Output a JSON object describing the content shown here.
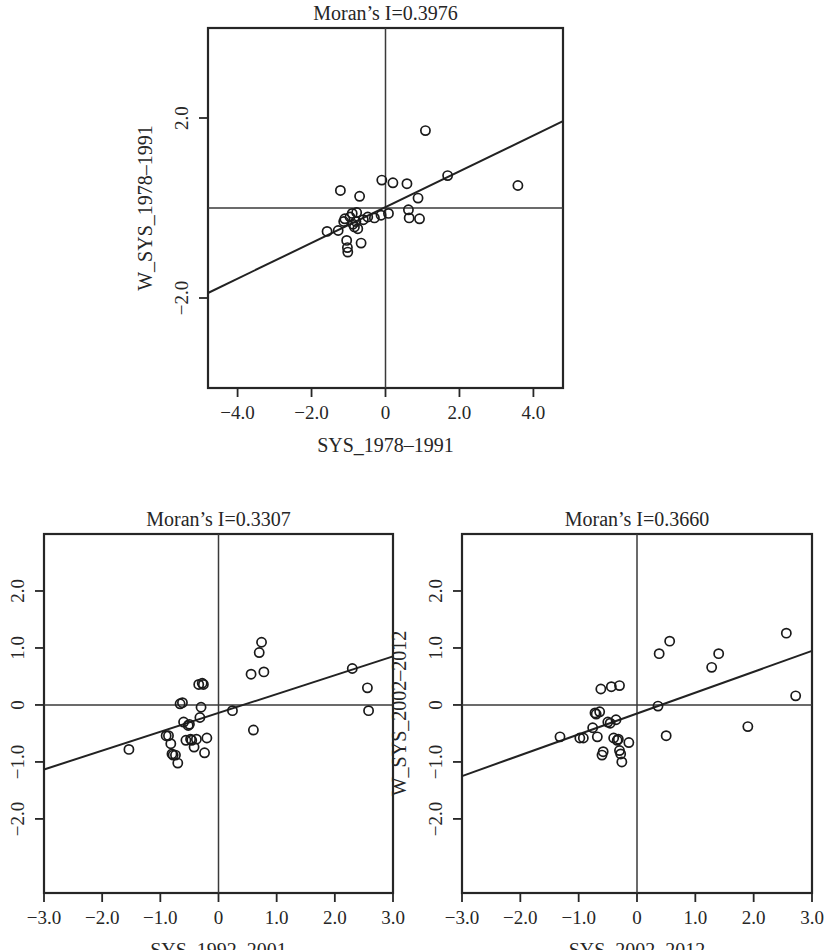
{
  "figure": {
    "background": "#ffffff",
    "marker_color": "#1a1a1a",
    "line_color": "#222222"
  },
  "chart_data": [
    {
      "type": "scatter",
      "id": "moran-1978-1991",
      "title": "Moran’s I=0.3976",
      "xlabel": "SYS_1978–1991",
      "ylabel": "W_SYS_1978–1991",
      "xlim": [
        -4.8,
        4.8
      ],
      "ylim": [
        -4.0,
        4.0
      ],
      "xticks": [
        -4.0,
        -2.0,
        0,
        2.0,
        4.0
      ],
      "xticklabels": [
        "−4.0",
        "−2.0",
        "0",
        "2.0",
        "4.0"
      ],
      "yticks": [
        2.0,
        -2.0
      ],
      "yticklabels": [
        "2.0",
        "−2.0"
      ],
      "grid": false,
      "zero_lines": true,
      "legend": null,
      "fit_line": {
        "slope": 0.3976,
        "intercept": 0.02
      },
      "points": [
        {
          "x": -1.58,
          "y": -0.52
        },
        {
          "x": -1.28,
          "y": -0.5
        },
        {
          "x": -1.22,
          "y": 0.39
        },
        {
          "x": -1.13,
          "y": -0.3
        },
        {
          "x": -1.1,
          "y": -0.24
        },
        {
          "x": -1.05,
          "y": -0.72
        },
        {
          "x": -1.03,
          "y": -0.88
        },
        {
          "x": -1.02,
          "y": -0.98
        },
        {
          "x": -0.96,
          "y": -0.2
        },
        {
          "x": -0.9,
          "y": -0.12
        },
        {
          "x": -0.88,
          "y": -0.36
        },
        {
          "x": -0.84,
          "y": -0.42
        },
        {
          "x": -0.8,
          "y": -0.3
        },
        {
          "x": -0.78,
          "y": -0.1
        },
        {
          "x": -0.75,
          "y": -0.46
        },
        {
          "x": -0.7,
          "y": 0.26
        },
        {
          "x": -0.66,
          "y": -0.78
        },
        {
          "x": -0.6,
          "y": -0.26
        },
        {
          "x": -0.48,
          "y": -0.2
        },
        {
          "x": -0.3,
          "y": -0.22
        },
        {
          "x": -0.12,
          "y": -0.16
        },
        {
          "x": -0.1,
          "y": 0.62
        },
        {
          "x": 0.08,
          "y": -0.12
        },
        {
          "x": 0.2,
          "y": 0.56
        },
        {
          "x": 0.58,
          "y": 0.54
        },
        {
          "x": 0.62,
          "y": -0.04
        },
        {
          "x": 0.64,
          "y": -0.22
        },
        {
          "x": 0.88,
          "y": 0.22
        },
        {
          "x": 0.92,
          "y": -0.24
        },
        {
          "x": 1.08,
          "y": 1.72
        },
        {
          "x": 1.68,
          "y": 0.72
        },
        {
          "x": 3.58,
          "y": 0.5
        }
      ]
    },
    {
      "type": "scatter",
      "id": "moran-1992-2001",
      "title": "Moran’s I=0.3307",
      "xlabel": "SYS_1992–2001",
      "ylabel": "W_SYS_1992–2001",
      "xlim": [
        -3.0,
        3.0
      ],
      "ylim": [
        -3.3,
        3.0
      ],
      "xticks": [
        -3.0,
        -2.0,
        -1.0,
        0,
        1.0,
        2.0,
        3.0
      ],
      "xticklabels": [
        "−3.0",
        "−2.0",
        "−1.0",
        "0",
        "1.0",
        "2.0",
        "3.0"
      ],
      "yticks": [
        2.0,
        1.0,
        0,
        -1.0,
        -2.0
      ],
      "yticklabels": [
        "2.0",
        "1.0",
        "0",
        "−1.0",
        "−2.0"
      ],
      "grid": false,
      "zero_lines": true,
      "legend": null,
      "fit_line": {
        "slope": 0.3307,
        "intercept": -0.14
      },
      "points": [
        {
          "x": -1.54,
          "y": -0.78
        },
        {
          "x": -0.9,
          "y": -0.54
        },
        {
          "x": -0.86,
          "y": -0.54
        },
        {
          "x": -0.82,
          "y": -0.68
        },
        {
          "x": -0.8,
          "y": -0.86
        },
        {
          "x": -0.78,
          "y": -0.88
        },
        {
          "x": -0.74,
          "y": -0.88
        },
        {
          "x": -0.7,
          "y": -1.02
        },
        {
          "x": -0.66,
          "y": 0.02
        },
        {
          "x": -0.62,
          "y": 0.04
        },
        {
          "x": -0.6,
          "y": -0.3
        },
        {
          "x": -0.56,
          "y": -0.62
        },
        {
          "x": -0.52,
          "y": -0.36
        },
        {
          "x": -0.5,
          "y": -0.34
        },
        {
          "x": -0.48,
          "y": -0.6
        },
        {
          "x": -0.46,
          "y": -0.62
        },
        {
          "x": -0.42,
          "y": -0.74
        },
        {
          "x": -0.38,
          "y": -0.6
        },
        {
          "x": -0.34,
          "y": 0.36
        },
        {
          "x": -0.32,
          "y": -0.22
        },
        {
          "x": -0.3,
          "y": -0.04
        },
        {
          "x": -0.28,
          "y": 0.38
        },
        {
          "x": -0.26,
          "y": 0.36
        },
        {
          "x": -0.24,
          "y": -0.84
        },
        {
          "x": -0.2,
          "y": -0.58
        },
        {
          "x": 0.24,
          "y": -0.1
        },
        {
          "x": 0.56,
          "y": 0.54
        },
        {
          "x": 0.6,
          "y": -0.44
        },
        {
          "x": 0.7,
          "y": 0.92
        },
        {
          "x": 0.74,
          "y": 1.1
        },
        {
          "x": 0.78,
          "y": 0.58
        },
        {
          "x": 2.3,
          "y": 0.64
        },
        {
          "x": 2.56,
          "y": 0.3
        },
        {
          "x": 2.58,
          "y": -0.1
        }
      ]
    },
    {
      "type": "scatter",
      "id": "moran-2002-2012",
      "title": "Moran’s I=0.3660",
      "xlabel": "SYS_2002–2012",
      "ylabel": "W_SYS_2002–2012",
      "xlim": [
        -3.0,
        3.0
      ],
      "ylim": [
        -3.3,
        3.0
      ],
      "xticks": [
        -3.0,
        -2.0,
        -1.0,
        0,
        1.0,
        2.0,
        3.0
      ],
      "xticklabels": [
        "−3.0",
        "−2.0",
        "−1.0",
        "0",
        "1.0",
        "2.0",
        "3.0"
      ],
      "yticks": [
        2.0,
        1.0,
        0,
        -1.0,
        -2.0
      ],
      "yticklabels": [
        "2.0",
        "1.0",
        "0",
        "−1.0",
        "−2.0"
      ],
      "grid": false,
      "zero_lines": true,
      "legend": null,
      "fit_line": {
        "slope": 0.366,
        "intercept": -0.15
      },
      "points": [
        {
          "x": -1.32,
          "y": -0.56
        },
        {
          "x": -0.98,
          "y": -0.58
        },
        {
          "x": -0.92,
          "y": -0.58
        },
        {
          "x": -0.76,
          "y": -0.4
        },
        {
          "x": -0.72,
          "y": -0.14
        },
        {
          "x": -0.7,
          "y": -0.16
        },
        {
          "x": -0.68,
          "y": -0.56
        },
        {
          "x": -0.64,
          "y": -0.12
        },
        {
          "x": -0.62,
          "y": 0.28
        },
        {
          "x": -0.6,
          "y": -0.88
        },
        {
          "x": -0.58,
          "y": -0.82
        },
        {
          "x": -0.5,
          "y": -0.3
        },
        {
          "x": -0.46,
          "y": -0.32
        },
        {
          "x": -0.44,
          "y": 0.32
        },
        {
          "x": -0.4,
          "y": -0.58
        },
        {
          "x": -0.36,
          "y": -0.26
        },
        {
          "x": -0.34,
          "y": -0.62
        },
        {
          "x": -0.32,
          "y": -0.6
        },
        {
          "x": -0.3,
          "y": 0.34
        },
        {
          "x": -0.3,
          "y": -0.8
        },
        {
          "x": -0.28,
          "y": -0.86
        },
        {
          "x": -0.26,
          "y": -1.0
        },
        {
          "x": -0.14,
          "y": -0.66
        },
        {
          "x": 0.36,
          "y": -0.02
        },
        {
          "x": 0.38,
          "y": 0.9
        },
        {
          "x": 0.5,
          "y": -0.54
        },
        {
          "x": 0.56,
          "y": 1.12
        },
        {
          "x": 1.28,
          "y": 0.66
        },
        {
          "x": 1.4,
          "y": 0.9
        },
        {
          "x": 1.9,
          "y": -0.38
        },
        {
          "x": 2.56,
          "y": 1.26
        },
        {
          "x": 2.72,
          "y": 0.16
        }
      ]
    }
  ]
}
